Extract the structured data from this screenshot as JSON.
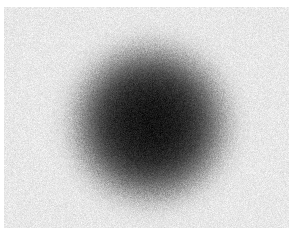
{
  "figure": {
    "name": "noisy-gaussian-blob",
    "kind": "raster-image",
    "width": 296,
    "height": 241,
    "page_background": "#ffffff",
    "caption": "",
    "title": "",
    "axis_labels": [],
    "tick_labels": [],
    "legend_entries": [],
    "annotations": []
  },
  "image_field": {
    "inset_left": 4,
    "inset_top": 7,
    "inset_right": 7,
    "inset_bottom": 13,
    "field_width": 285,
    "field_height": 221,
    "background_gray": "#e8e8e8",
    "background_noise_amplitude": 22,
    "noise_grain_px": 1
  },
  "blob": {
    "shape": "gaussian-disc",
    "center_x": 150,
    "center_y": 123,
    "core_radius": 55,
    "falloff_radius": 92,
    "core_gray": "#141414",
    "edge_gray": "#e8e8e8",
    "core_noise_amplitude": 26,
    "edge_noise_amplitude": 34
  },
  "chart_data": {
    "type": "heatmap",
    "title": "",
    "xlabel": "",
    "ylabel": "",
    "grid": false,
    "legend_position": "none",
    "colormap": "grayscale",
    "value_range": [
      0,
      255
    ],
    "x": [
      0,
      285
    ],
    "y": [
      0,
      221
    ],
    "field": {
      "background_level": 232,
      "blob_center_level": 20,
      "blob_center_xy": [
        146,
        116
      ],
      "blob_core_radius": 55,
      "blob_falloff_radius": 92,
      "noise_sigma_background": 11,
      "noise_sigma_core": 13
    },
    "radial_profile": {
      "label": "mean gray level vs. radius from blob center (px)",
      "radius": [
        0,
        10,
        20,
        30,
        40,
        50,
        60,
        70,
        80,
        90,
        100,
        110
      ],
      "gray_level": [
        20,
        22,
        26,
        34,
        48,
        72,
        108,
        152,
        194,
        220,
        230,
        232
      ]
    }
  }
}
